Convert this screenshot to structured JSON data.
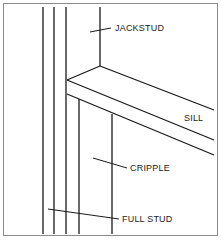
{
  "diagram": {
    "labels": {
      "jackstud": "JACKSTUD",
      "sill": "SILL",
      "cripple": "CRIPPLE",
      "full_stud": "FULL STUD"
    },
    "line_color": "#1a1a1a",
    "border_color": "#8a8a8a"
  }
}
